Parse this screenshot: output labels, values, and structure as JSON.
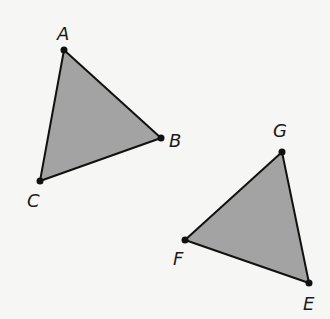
{
  "diagram": {
    "title": "",
    "style": {
      "background": "#f6f6f4",
      "fill": "#a3a3a3",
      "stroke": "#111111",
      "label_color": "#1a1a1a"
    },
    "triangles": [
      {
        "name": "ABC",
        "vertices": [
          {
            "label": "A",
            "x": 64,
            "y": 50,
            "label_x": 57,
            "label_y": 40
          },
          {
            "label": "B",
            "x": 161,
            "y": 138,
            "label_x": 169,
            "label_y": 147
          },
          {
            "label": "C",
            "x": 40,
            "y": 181,
            "label_x": 27,
            "label_y": 207
          }
        ]
      },
      {
        "name": "EFG",
        "vertices": [
          {
            "label": "G",
            "x": 282,
            "y": 152,
            "label_x": 273,
            "label_y": 137
          },
          {
            "label": "F",
            "x": 185,
            "y": 240,
            "label_x": 173,
            "label_y": 265
          },
          {
            "label": "E",
            "x": 309,
            "y": 283,
            "label_x": 303,
            "label_y": 310
          }
        ]
      }
    ]
  }
}
